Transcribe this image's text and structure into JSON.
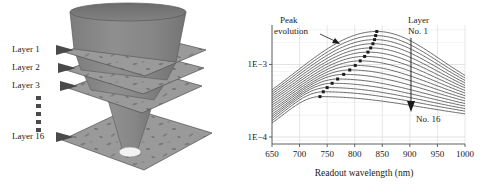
{
  "figure": {
    "left_panel": {
      "name": "layered-scattering-medium-diagram",
      "layer_labels": [
        "Layer 1",
        "Layer 2",
        "Layer 3",
        "Layer 16"
      ],
      "ellipsis_symbol": "▪",
      "ellipsis_count": 5,
      "colors": {
        "cone": "#8c8c8c",
        "cone_dark": "#707070",
        "plane": "#9a9a9a",
        "plane_speckle": "#6e6e6e",
        "spot": "#f2f2f2",
        "outline": "#4a4a4a"
      }
    },
    "right_panel": {
      "name": "scattering-signal-ratio-plot"
    }
  },
  "chart_data": {
    "type": "line",
    "title": "",
    "xlabel": "Readout wavelength (nm)",
    "ylabel": "Scattering signal ratio ξ(λ, n)",
    "xlim": [
      650,
      1000
    ],
    "ylim": [
      8e-05,
      0.0035
    ],
    "yscale": "log",
    "xticks": [
      650,
      700,
      750,
      800,
      850,
      900,
      950,
      1000
    ],
    "xticklabels": [
      "650",
      "700",
      "750",
      "800",
      "850",
      "900",
      "950",
      "1000"
    ],
    "yticks": [
      0.0001,
      0.001
    ],
    "yticklabels": [
      "1E−4",
      "1E−3"
    ],
    "grid": true,
    "legend": "none",
    "annotations": [
      {
        "text": "Peak evolution",
        "lines": [
          "Peak",
          "evolution"
        ],
        "type": "arrow-label",
        "points_to": "peak-locus"
      },
      {
        "text": "Layer No. 1",
        "lines": [
          "Layer",
          "No. 1"
        ],
        "type": "arrow-start",
        "at_x": 905
      },
      {
        "text": "No. 16",
        "lines": [
          "No. 16"
        ],
        "type": "arrow-end",
        "at_x": 905
      }
    ],
    "series_count": 16,
    "series": [
      {
        "name": "Layer No. 1",
        "peak_x": 840,
        "peak_y": 0.00285,
        "left_y": 0.000105,
        "right_y": 0.0003
      },
      {
        "name": "Layer No. 2",
        "peak_x": 838,
        "peak_y": 0.0025,
        "left_y": 0.000103,
        "right_y": 0.000285
      },
      {
        "name": "Layer No. 3",
        "peak_x": 836,
        "peak_y": 0.0022,
        "left_y": 0.000101,
        "right_y": 0.000272
      },
      {
        "name": "Layer No. 4",
        "peak_x": 833,
        "peak_y": 0.00193,
        "left_y": 9.9e-05,
        "right_y": 0.000259
      },
      {
        "name": "Layer No. 5",
        "peak_x": 829,
        "peak_y": 0.00169,
        "left_y": 9.7e-05,
        "right_y": 0.000247
      },
      {
        "name": "Layer No. 6",
        "peak_x": 824,
        "peak_y": 0.00148,
        "left_y": 9.6e-05,
        "right_y": 0.000236
      },
      {
        "name": "Layer No. 7",
        "peak_x": 818,
        "peak_y": 0.00129,
        "left_y": 9.4e-05,
        "right_y": 0.000225
      },
      {
        "name": "Layer No. 8",
        "peak_x": 810,
        "peak_y": 0.00112,
        "left_y": 9.2e-05,
        "right_y": 0.000215
      },
      {
        "name": "Layer No. 9",
        "peak_x": 801,
        "peak_y": 0.00097,
        "left_y": 9.1e-05,
        "right_y": 0.000205
      },
      {
        "name": "Layer No. 10",
        "peak_x": 791,
        "peak_y": 0.00084,
        "left_y": 8.9e-05,
        "right_y": 0.000196
      },
      {
        "name": "Layer No. 11",
        "peak_x": 780,
        "peak_y": 0.00073,
        "left_y": 8.8e-05,
        "right_y": 0.000187
      },
      {
        "name": "Layer No. 12",
        "peak_x": 769,
        "peak_y": 0.00063,
        "left_y": 8.6e-05,
        "right_y": 0.000179
      },
      {
        "name": "Layer No. 13",
        "peak_x": 759,
        "peak_y": 0.00055,
        "left_y": 8.5e-05,
        "right_y": 0.000171
      },
      {
        "name": "Layer No. 14",
        "peak_x": 750,
        "peak_y": 0.00048,
        "left_y": 8.4e-05,
        "right_y": 0.000163
      },
      {
        "name": "Layer No. 15",
        "peak_x": 743,
        "peak_y": 0.00042,
        "left_y": 8.2e-05,
        "right_y": 0.000156
      },
      {
        "name": "Layer No. 16",
        "peak_x": 737,
        "peak_y": 0.00036,
        "left_y": 8.1e-05,
        "right_y": 0.000149
      }
    ],
    "peak_markers": [
      {
        "x": 840,
        "y": 0.00285
      },
      {
        "x": 838,
        "y": 0.0025
      },
      {
        "x": 836,
        "y": 0.0022
      },
      {
        "x": 833,
        "y": 0.00193
      },
      {
        "x": 829,
        "y": 0.00169
      },
      {
        "x": 824,
        "y": 0.00148
      },
      {
        "x": 818,
        "y": 0.00129
      },
      {
        "x": 810,
        "y": 0.00112
      },
      {
        "x": 801,
        "y": 0.00097
      },
      {
        "x": 791,
        "y": 0.00084
      },
      {
        "x": 780,
        "y": 0.00073
      },
      {
        "x": 769,
        "y": 0.00063
      },
      {
        "x": 759,
        "y": 0.00055
      },
      {
        "x": 750,
        "y": 0.00048
      },
      {
        "x": 743,
        "y": 0.00042
      },
      {
        "x": 737,
        "y": 0.00036
      }
    ],
    "colors": {
      "curve": "#3a3a3a",
      "marker": "#1a1a1a",
      "grid": "#cfcfcf",
      "axis": "#555555"
    }
  }
}
